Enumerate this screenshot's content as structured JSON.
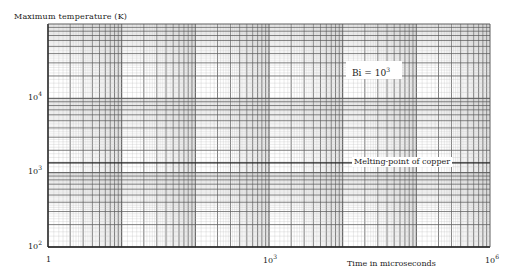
{
  "chart_data": {
    "type": "line",
    "title": "",
    "xlabel": "Time in microseconds",
    "ylabel": "Maximum temperature (K)",
    "x_scale": "log",
    "y_scale": "log",
    "xlim": [
      1,
      1000000
    ],
    "ylim": [
      100,
      100000
    ],
    "x_ticks": [
      {
        "base": "1",
        "exp": ""
      },
      {
        "base": "10",
        "exp": "3"
      },
      {
        "base": "10",
        "exp": "6"
      }
    ],
    "y_ticks": [
      {
        "base": "10",
        "exp": "2"
      },
      {
        "base": "10",
        "exp": "3"
      },
      {
        "base": "10",
        "exp": "4"
      }
    ],
    "grid": true,
    "series": [],
    "reference_lines": [
      {
        "label": "Melting-point of copper",
        "y": 1356,
        "orientation": "horizontal"
      }
    ],
    "annotations": [
      {
        "text_base": "Bi = 10",
        "text_exp": "3"
      }
    ]
  },
  "labels": {
    "ylabel": "Maximum temperature (K)",
    "xlabel": "Time in microseconds",
    "melting": "Melting-point of copper",
    "bi_base": "Bi  =  10",
    "bi_exp": "3",
    "y2": "10",
    "y2e": "2",
    "y3": "10",
    "y3e": "3",
    "y4": "10",
    "y4e": "4",
    "x0": "1",
    "x3": "10",
    "x3e": "3",
    "x6": "10",
    "x6e": "6"
  }
}
